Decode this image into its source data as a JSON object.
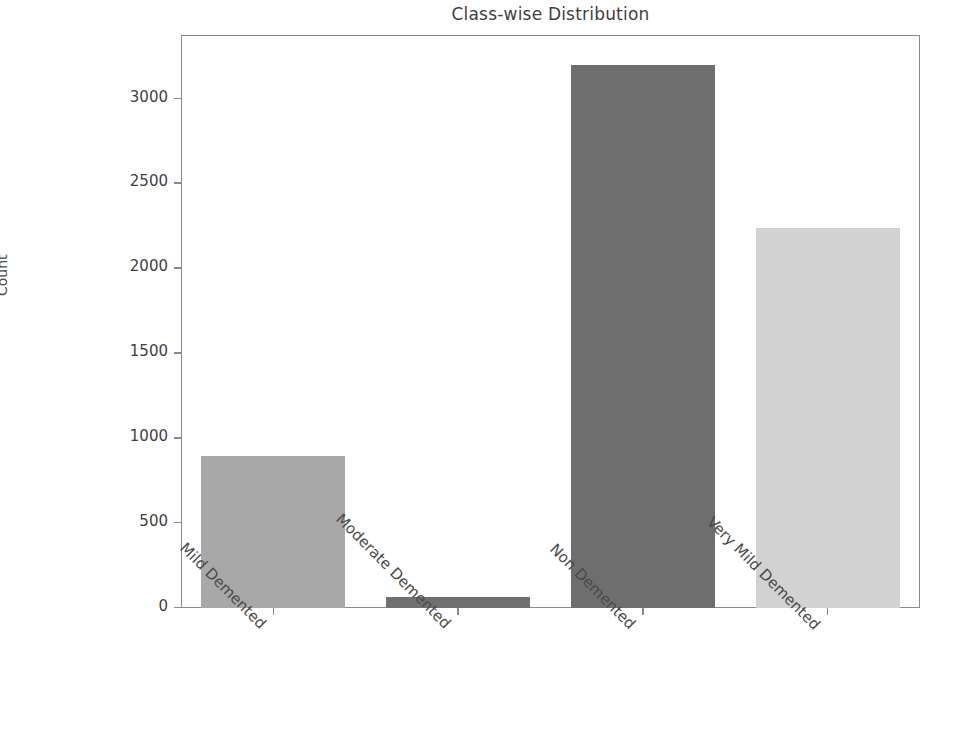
{
  "chart_data": {
    "type": "bar",
    "title": "Class-wise Distribution",
    "xlabel": "",
    "ylabel": "Count",
    "categories": [
      "Mild Demented",
      "Moderate Demented",
      "Non Demented",
      "Very Mild Demented"
    ],
    "values": [
      896,
      64,
      3200,
      2240
    ],
    "bar_colors": [
      "#a8a8a8",
      "#707070",
      "#6e6e6e",
      "#d2d2d2"
    ],
    "ylim": [
      0,
      3374
    ],
    "yticks": [
      0,
      500,
      1000,
      1500,
      2000,
      2500,
      3000
    ],
    "ytick_labels": [
      "0",
      "500",
      "1000",
      "1500",
      "2000",
      "2500",
      "3000"
    ],
    "grid": false,
    "legend": "none",
    "xtick_label_rotation": 45
  },
  "figure": {
    "background_color": "#ffffff",
    "axis_color": "#8a8a8a",
    "text_color": "#3f3f3f"
  }
}
